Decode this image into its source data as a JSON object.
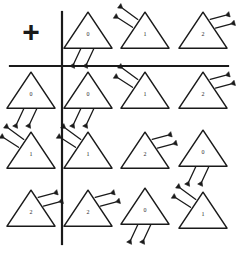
{
  "figure": {
    "kind": "cayley-table",
    "operator_symbol": "+",
    "background_color": "#ffffff",
    "ink_color": "#1a1a1a",
    "rule_color": "#1a1a1a",
    "columns": 4,
    "rows": 4,
    "vertical_rule_x": 62,
    "horizontal_rule_y": 66
  },
  "orientations": {
    "0": {
      "name": "legs-bottom",
      "label": "0"
    },
    "1": {
      "name": "legs-upper-left",
      "label": "1"
    },
    "2": {
      "name": "legs-upper-right",
      "label": "2"
    }
  },
  "cells": [
    {
      "row": 0,
      "col": 0,
      "type": "operator",
      "name": "operator-cell",
      "label": "+",
      "cx": 31,
      "cy": 34
    },
    {
      "row": 0,
      "col": 1,
      "type": "header-col",
      "name": "column-header-0",
      "digit": "0",
      "orientation": "0",
      "cx": 88,
      "cy": 32
    },
    {
      "row": 0,
      "col": 2,
      "type": "header-col",
      "name": "column-header-1",
      "digit": "1",
      "orientation": "1",
      "cx": 145,
      "cy": 32
    },
    {
      "row": 0,
      "col": 3,
      "type": "header-col",
      "name": "column-header-2",
      "digit": "2",
      "orientation": "2",
      "cx": 203,
      "cy": 32
    },
    {
      "row": 1,
      "col": 0,
      "type": "header-row",
      "name": "row-header-0",
      "digit": "0",
      "orientation": "0",
      "cx": 31,
      "cy": 92
    },
    {
      "row": 1,
      "col": 1,
      "type": "body",
      "name": "result-0-0",
      "digit": "0",
      "orientation": "0",
      "cx": 88,
      "cy": 92
    },
    {
      "row": 1,
      "col": 2,
      "type": "body",
      "name": "result-0-1",
      "digit": "1",
      "orientation": "1",
      "cx": 145,
      "cy": 92
    },
    {
      "row": 1,
      "col": 3,
      "type": "body",
      "name": "result-0-2",
      "digit": "2",
      "orientation": "2",
      "cx": 203,
      "cy": 92
    },
    {
      "row": 2,
      "col": 0,
      "type": "header-row",
      "name": "row-header-1",
      "digit": "1",
      "orientation": "1",
      "cx": 31,
      "cy": 152
    },
    {
      "row": 2,
      "col": 1,
      "type": "body",
      "name": "result-1-0",
      "digit": "1",
      "orientation": "1",
      "cx": 88,
      "cy": 152
    },
    {
      "row": 2,
      "col": 2,
      "type": "body",
      "name": "result-1-1",
      "digit": "2",
      "orientation": "2",
      "cx": 145,
      "cy": 152
    },
    {
      "row": 2,
      "col": 3,
      "type": "body",
      "name": "result-1-2",
      "digit": "0",
      "orientation": "0",
      "cx": 203,
      "cy": 150
    },
    {
      "row": 3,
      "col": 0,
      "type": "header-row",
      "name": "row-header-2",
      "digit": "2",
      "orientation": "2",
      "cx": 31,
      "cy": 210
    },
    {
      "row": 3,
      "col": 1,
      "type": "body",
      "name": "result-2-0",
      "digit": "2",
      "orientation": "2",
      "cx": 88,
      "cy": 210
    },
    {
      "row": 3,
      "col": 2,
      "type": "body",
      "name": "result-2-1",
      "digit": "0",
      "orientation": "0",
      "cx": 145,
      "cy": 208
    },
    {
      "row": 3,
      "col": 3,
      "type": "body",
      "name": "result-2-2",
      "digit": "1",
      "orientation": "1",
      "cx": 203,
      "cy": 212
    }
  ]
}
